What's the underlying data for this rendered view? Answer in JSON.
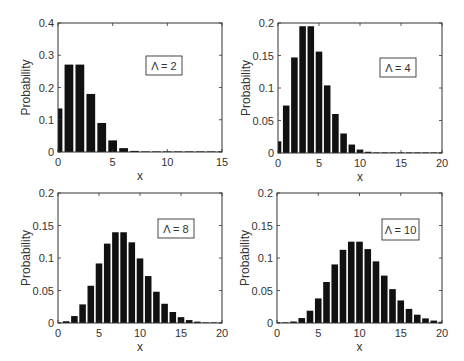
{
  "figure": {
    "title": "",
    "panels": [
      {
        "id": "lambda2",
        "legend": "Λ = 2",
        "xlabel": "x",
        "ylabel": "Probability"
      },
      {
        "id": "lambda4",
        "legend": "Λ = 4",
        "xlabel": "x",
        "ylabel": "Probability"
      },
      {
        "id": "lambda8",
        "legend": "Λ = 8",
        "xlabel": "x",
        "ylabel": "Probability"
      },
      {
        "id": "lambda10",
        "legend": "Λ = 10",
        "xlabel": "x",
        "ylabel": "Probability"
      }
    ]
  },
  "chart_data": [
    {
      "type": "bar",
      "title": "",
      "legend": "Λ = 2",
      "xlabel": "x",
      "ylabel": "Probability",
      "xlim": [
        0,
        15
      ],
      "ylim": [
        0,
        0.4
      ],
      "xticks": [
        0,
        5,
        10,
        15
      ],
      "yticks": [
        0,
        0.1,
        0.2,
        0.3,
        0.4
      ],
      "ytick_labels": [
        "0",
        "0.1",
        "0.2",
        "0.3",
        "0.4"
      ],
      "x": [
        0,
        1,
        2,
        3,
        4,
        5,
        6,
        7,
        8,
        9,
        10,
        11,
        12,
        13,
        14,
        15
      ],
      "values": [
        0.135,
        0.271,
        0.271,
        0.18,
        0.09,
        0.036,
        0.012,
        0.0034,
        0.0009,
        0.0002,
        4e-05,
        1e-05,
        0,
        0,
        0,
        0
      ],
      "bar_color": "#111111"
    },
    {
      "type": "bar",
      "title": "",
      "legend": "Λ = 4",
      "xlabel": "x",
      "ylabel": "Probability",
      "xlim": [
        0,
        20
      ],
      "ylim": [
        0,
        0.2
      ],
      "xticks": [
        0,
        5,
        10,
        15,
        20
      ],
      "yticks": [
        0,
        0.05,
        0.1,
        0.15,
        0.2
      ],
      "ytick_labels": [
        "0",
        "0.05",
        "0.1",
        "0.15",
        "0.2"
      ],
      "x": [
        0,
        1,
        2,
        3,
        4,
        5,
        6,
        7,
        8,
        9,
        10,
        11,
        12,
        13,
        14,
        15,
        16,
        17,
        18,
        19,
        20
      ],
      "values": [
        0.018,
        0.073,
        0.147,
        0.195,
        0.195,
        0.156,
        0.104,
        0.06,
        0.03,
        0.013,
        0.0053,
        0.0019,
        0.0006,
        0.0002,
        5e-05,
        1e-05,
        0,
        0,
        0,
        0,
        0
      ],
      "bar_color": "#111111"
    },
    {
      "type": "bar",
      "title": "",
      "legend": "Λ = 8",
      "xlabel": "x",
      "ylabel": "Probability",
      "xlim": [
        0,
        20
      ],
      "ylim": [
        0,
        0.2
      ],
      "xticks": [
        0,
        5,
        10,
        15,
        20
      ],
      "yticks": [
        0,
        0.05,
        0.1,
        0.15,
        0.2
      ],
      "ytick_labels": [
        "0",
        "0.05",
        "0.1",
        "0.15",
        "0.2"
      ],
      "x": [
        0,
        1,
        2,
        3,
        4,
        5,
        6,
        7,
        8,
        9,
        10,
        11,
        12,
        13,
        14,
        15,
        16,
        17,
        18,
        19,
        20
      ],
      "values": [
        0.0003,
        0.0027,
        0.0107,
        0.0286,
        0.0573,
        0.0916,
        0.1221,
        0.1396,
        0.1396,
        0.1241,
        0.0993,
        0.0722,
        0.0481,
        0.0296,
        0.0169,
        0.009,
        0.0045,
        0.0021,
        0.0009,
        0.0004,
        0.0002
      ],
      "bar_color": "#111111"
    },
    {
      "type": "bar",
      "title": "",
      "legend": "Λ = 10",
      "xlabel": "x",
      "ylabel": "Probability",
      "xlim": [
        0,
        20
      ],
      "ylim": [
        0,
        0.2
      ],
      "xticks": [
        0,
        5,
        10,
        15,
        20
      ],
      "yticks": [
        0,
        0.05,
        0.1,
        0.15,
        0.2
      ],
      "ytick_labels": [
        "0",
        "0.05",
        "0.1",
        "0.15",
        "0.2"
      ],
      "x": [
        0,
        1,
        2,
        3,
        4,
        5,
        6,
        7,
        8,
        9,
        10,
        11,
        12,
        13,
        14,
        15,
        16,
        17,
        18,
        19,
        20
      ],
      "values": [
        5e-05,
        0.0005,
        0.0023,
        0.0076,
        0.0189,
        0.0378,
        0.0631,
        0.0901,
        0.1126,
        0.1251,
        0.1251,
        0.1137,
        0.0948,
        0.0729,
        0.0521,
        0.0347,
        0.0217,
        0.0128,
        0.0071,
        0.0037,
        0.0019
      ],
      "bar_color": "#111111"
    }
  ]
}
